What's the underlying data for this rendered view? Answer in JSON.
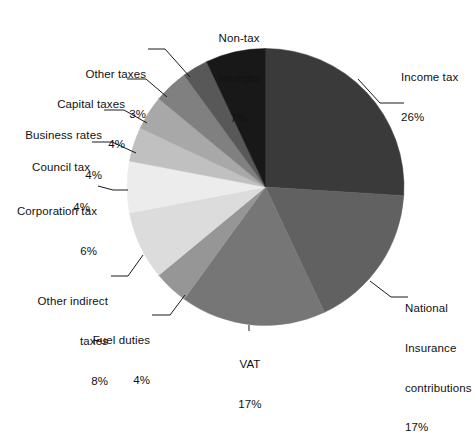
{
  "chart_data": {
    "type": "pie",
    "title": "",
    "subtitle": "",
    "xlabel": "",
    "ylabel": "",
    "legend_position": "none",
    "grid": false,
    "units": "percent",
    "start_angle_deg": 0,
    "direction": "clockwise",
    "categories": [
      "Income tax",
      "National Insurance contributions",
      "VAT",
      "Fuel duties",
      "Other indirect taxes",
      "Corporation tax",
      "Council tax",
      "Business rates",
      "Capital taxes",
      "Other taxes",
      "Non-tax receipts"
    ],
    "values": [
      26,
      17,
      17,
      4,
      8,
      6,
      4,
      4,
      4,
      3,
      7
    ],
    "value_labels": [
      "26%",
      "17%",
      "17%",
      "4%",
      "8%",
      "6%",
      "4%",
      "4%",
      "4%",
      "3%",
      "7%"
    ],
    "colors": [
      "#3a3a3a",
      "#616161",
      "#767676",
      "#969696",
      "#dcdcdc",
      "#ececec",
      "#c0c0c0",
      "#a8a8a8",
      "#808080",
      "#585858",
      "#181818"
    ],
    "slices": [
      {
        "name": "Income tax",
        "value": 26,
        "label": "Income tax",
        "value_label": "26%",
        "color": "#3a3a3a"
      },
      {
        "name": "National Insurance contributions",
        "value": 17,
        "label": "National\nInsurance\ncontributions",
        "value_label": "17%",
        "color": "#616161"
      },
      {
        "name": "VAT",
        "value": 17,
        "label": "VAT",
        "value_label": "17%",
        "color": "#767676"
      },
      {
        "name": "Fuel duties",
        "value": 4,
        "label": "Fuel duties",
        "value_label": "4%",
        "color": "#969696"
      },
      {
        "name": "Other indirect taxes",
        "value": 8,
        "label": "Other indirect\ntaxes",
        "value_label": "8%",
        "color": "#dcdcdc"
      },
      {
        "name": "Corporation tax",
        "value": 6,
        "label": "Corporation tax",
        "value_label": "6%",
        "color": "#ececec"
      },
      {
        "name": "Council tax",
        "value": 4,
        "label": "Council tax",
        "value_label": "4%",
        "color": "#c0c0c0"
      },
      {
        "name": "Business rates",
        "value": 4,
        "label": "Business rates",
        "value_label": "4%",
        "color": "#a8a8a8"
      },
      {
        "name": "Capital taxes",
        "value": 4,
        "label": "Capital taxes",
        "value_label": "4%",
        "color": "#808080"
      },
      {
        "name": "Other taxes",
        "value": 3,
        "label": "Other taxes",
        "value_label": "3%",
        "color": "#585858"
      },
      {
        "name": "Non-tax receipts",
        "value": 7,
        "label": "Non-tax\nreceipts",
        "value_label": "7%",
        "color": "#181818"
      }
    ]
  },
  "labels": {
    "income_tax": {
      "name": "Income tax",
      "pct": "26%"
    },
    "national_insurance": {
      "line1": "National",
      "line2": "Insurance",
      "line3": "contributions",
      "pct": "17%"
    },
    "vat": {
      "name": "VAT",
      "pct": "17%"
    },
    "fuel_duties": {
      "name": "Fuel duties",
      "pct": "4%"
    },
    "other_indirect": {
      "line1": "Other indirect",
      "line2": "taxes",
      "pct": "8%"
    },
    "corporation_tax": {
      "name": "Corporation tax",
      "pct": "6%"
    },
    "council_tax": {
      "name": "Council tax",
      "pct": "4%"
    },
    "business_rates": {
      "name": "Business rates",
      "pct": "4%"
    },
    "capital_taxes": {
      "name": "Capital taxes",
      "pct": "4%"
    },
    "other_taxes": {
      "name": "Other taxes",
      "pct": "3%"
    },
    "non_tax_receipts": {
      "line1": "Non-tax",
      "line2": "receipts",
      "pct": "7%"
    }
  }
}
